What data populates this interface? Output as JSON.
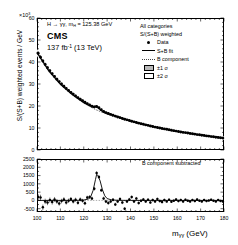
{
  "figure": {
    "exponent_label": "×10",
    "exponent_power": "3",
    "yaxis_title": "S/(S+B) weighted events / GeV",
    "xaxis_title_m": "m",
    "xaxis_title_sub": "γγ",
    "xaxis_title_unit": " (GeV)",
    "process_label_pre": "H → ",
    "process_label_gg": "γγ",
    "process_label_mass": ", m",
    "process_label_msub": "H",
    "process_label_val": " = 125.38 GeV",
    "experiment": "CMS",
    "lumi_value": "137 fb",
    "lumi_sup": "-1",
    "lumi_energy": " (13 TeV)",
    "lower_panel_label": "B component subtracted"
  },
  "legend": {
    "header1": "All categories",
    "header2": "S/(S+B) weighted",
    "entries": [
      {
        "label": "Data",
        "key": "marker"
      },
      {
        "label": "S+B fit",
        "key": "solid-line"
      },
      {
        "label": "B component",
        "key": "dotted-line"
      },
      {
        "label": "±1 σ",
        "key": "filled-box"
      },
      {
        "label": "±2 σ",
        "key": "open-box"
      }
    ]
  },
  "colors": {
    "axis": "#000000",
    "data": "#000000",
    "fit": "#000000",
    "bcomponent": "#444444",
    "band1sigma": "#b9b9b9",
    "band2sigma": "#ffffff",
    "background": "#ffffff"
  },
  "chart_data": {
    "type": "line",
    "xlabel": "m_γγ (GeV)",
    "ylabel": "S/(S+B) weighted events / GeV",
    "xlim": [
      100,
      180
    ],
    "ylim": [
      0,
      60
    ],
    "y_scale_factor": 1000,
    "grid": false,
    "xticks": [
      100,
      110,
      120,
      130,
      140,
      150,
      160,
      170,
      180
    ],
    "yticks": [
      0,
      10,
      20,
      30,
      40,
      50,
      60
    ],
    "panels": [
      {
        "name": "upper",
        "ylabel": "S/(S+B) weighted events / GeV",
        "ylim": [
          0,
          60
        ],
        "yticks": [
          0,
          10,
          20,
          30,
          40,
          50,
          60
        ],
        "series": [
          {
            "name": "Data",
            "type": "scatter",
            "x": [
              100.5,
              101.5,
              102.5,
              103.5,
              104.5,
              105.5,
              106.5,
              107.5,
              108.5,
              109.5,
              110.5,
              111.5,
              112.5,
              113.5,
              114.5,
              115.5,
              116.5,
              117.5,
              118.5,
              119.5,
              120.5,
              121.5,
              122.5,
              123.5,
              124.5,
              125.5,
              126.5,
              127.5,
              128.5,
              129.5,
              130.5,
              131.5,
              132.5,
              133.5,
              134.5,
              135.5,
              136.5,
              137.5,
              138.5,
              139.5,
              140.5,
              141.5,
              142.5,
              143.5,
              144.5,
              145.5,
              146.5,
              147.5,
              148.5,
              149.5,
              150.5,
              151.5,
              152.5,
              153.5,
              154.5,
              155.5,
              156.5,
              157.5,
              158.5,
              159.5,
              160.5,
              161.5,
              162.5,
              163.5,
              164.5,
              165.5,
              166.5,
              167.5,
              168.5,
              169.5,
              170.5,
              171.5,
              172.5,
              173.5,
              174.5,
              175.5,
              176.5,
              177.5,
              178.5,
              179.5
            ],
            "y": [
              44.0,
              42.2,
              40.5,
              38.9,
              37.4,
              36.0,
              34.7,
              33.4,
              32.2,
              31.1,
              30.0,
              29.0,
              28.0,
              27.1,
              26.2,
              25.4,
              24.6,
              23.8,
              23.1,
              22.4,
              21.7,
              21.1,
              20.5,
              19.9,
              19.6,
              19.8,
              19.2,
              18.3,
              17.5,
              17.0,
              16.6,
              16.2,
              15.8,
              15.4,
              15.0,
              14.7,
              14.3,
              14.0,
              13.7,
              13.4,
              13.1,
              12.8,
              12.5,
              12.2,
              11.9,
              11.7,
              11.4,
              11.2,
              10.9,
              10.7,
              10.4,
              10.2,
              10.0,
              9.8,
              9.6,
              9.4,
              9.2,
              9.0,
              8.8,
              8.6,
              8.4,
              8.2,
              8.0,
              7.9,
              7.7,
              7.5,
              7.4,
              7.2,
              7.0,
              6.9,
              6.7,
              6.6,
              6.4,
              6.3,
              6.1,
              6.0,
              5.8,
              5.7,
              5.6,
              5.4
            ],
            "yerr": [
              0.9,
              0.9,
              0.8,
              0.8,
              0.8,
              0.8,
              0.7,
              0.7,
              0.7,
              0.7,
              0.7,
              0.7,
              0.6,
              0.6,
              0.6,
              0.6,
              0.6,
              0.6,
              0.6,
              0.6,
              0.6,
              0.5,
              0.5,
              0.5,
              0.5,
              0.5,
              0.5,
              0.5,
              0.5,
              0.5,
              0.5,
              0.5,
              0.5,
              0.5,
              0.4,
              0.4,
              0.4,
              0.4,
              0.4,
              0.4,
              0.4,
              0.4,
              0.4,
              0.4,
              0.4,
              0.4,
              0.4,
              0.4,
              0.4,
              0.4,
              0.4,
              0.3,
              0.3,
              0.3,
              0.3,
              0.3,
              0.3,
              0.3,
              0.3,
              0.3,
              0.3,
              0.3,
              0.3,
              0.3,
              0.3,
              0.3,
              0.3,
              0.3,
              0.3,
              0.3,
              0.3,
              0.3,
              0.3,
              0.3,
              0.3,
              0.3,
              0.3,
              0.3,
              0.3,
              0.3
            ]
          },
          {
            "name": "S+B fit",
            "type": "line",
            "x": [
              100,
              105,
              110,
              115,
              120,
              122,
              124,
              125,
              126,
              127,
              128,
              130,
              135,
              140,
              145,
              150,
              155,
              160,
              165,
              170,
              175,
              180
            ],
            "y": [
              44.3,
              36.1,
              30.0,
              25.3,
              21.6,
              20.4,
              19.6,
              19.8,
              19.4,
              18.4,
              17.6,
              16.6,
              15.0,
              13.2,
              11.8,
              10.5,
              9.4,
              8.4,
              7.6,
              6.8,
              6.1,
              5.4
            ]
          },
          {
            "name": "B component",
            "type": "line",
            "x": [
              100,
              105,
              110,
              115,
              120,
              125,
              130,
              135,
              140,
              145,
              150,
              155,
              160,
              165,
              170,
              175,
              180
            ],
            "y": [
              44.3,
              36.1,
              30.0,
              25.3,
              21.5,
              18.4,
              16.2,
              14.6,
              13.1,
              11.8,
              10.5,
              9.4,
              8.4,
              7.6,
              6.8,
              6.1,
              5.4
            ]
          }
        ]
      },
      {
        "name": "lower",
        "label": "B component subtracted",
        "ylim": [
          -700,
          2500
        ],
        "yticks": [
          -500,
          0,
          500,
          1000,
          1500,
          2000,
          2500
        ],
        "series": [
          {
            "name": "Data minus B",
            "type": "scatter",
            "x": [
              100.5,
              101.5,
              102.5,
              103.5,
              104.5,
              105.5,
              106.5,
              107.5,
              108.5,
              109.5,
              110.5,
              111.5,
              112.5,
              113.5,
              114.5,
              115.5,
              116.5,
              117.5,
              118.5,
              119.5,
              120.5,
              121.5,
              122.5,
              123.5,
              124.5,
              125.5,
              126.5,
              127.5,
              128.5,
              129.5,
              130.5,
              131.5,
              132.5,
              133.5,
              134.5,
              135.5,
              136.5,
              137.5,
              138.5,
              139.5,
              140.5,
              141.5,
              142.5,
              143.5,
              144.5,
              145.5,
              146.5,
              147.5,
              148.5,
              149.5,
              150.5,
              151.5,
              152.5,
              153.5,
              154.5,
              155.5,
              156.5,
              157.5,
              158.5,
              159.5,
              160.5,
              161.5,
              162.5,
              163.5,
              164.5,
              165.5,
              166.5,
              167.5,
              168.5,
              169.5,
              170.5,
              171.5,
              172.5,
              173.5,
              174.5,
              175.5,
              176.5,
              177.5,
              178.5,
              179.5
            ],
            "y": [
              200,
              170,
              -420,
              -60,
              -130,
              20,
              -100,
              60,
              -60,
              -180,
              -40,
              60,
              -120,
              -20,
              80,
              -60,
              40,
              -140,
              60,
              -20,
              -170,
              170,
              200,
              120,
              700,
              1650,
              1420,
              620,
              120,
              -60,
              -150,
              -60,
              40,
              -240,
              -60,
              80,
              -130,
              -500,
              -60,
              60,
              200,
              -60,
              120,
              -160,
              -20,
              60,
              -60,
              40,
              -120,
              20,
              -60,
              80,
              -40,
              -100,
              20,
              -60,
              40,
              -80,
              -20,
              60,
              -40,
              20,
              -60,
              40,
              -20,
              -60,
              20,
              -40,
              60,
              -20,
              -60,
              20,
              -40,
              -10,
              40,
              -20,
              -60,
              20,
              -30,
              -60
            ],
            "yerr": [
              180,
              175,
              170,
              165,
              160,
              156,
              152,
              148,
              145,
              142,
              139,
              136,
              133,
              130,
              128,
              126,
              124,
              122,
              120,
              118,
              116,
              114,
              113,
              111,
              110,
              109,
              108,
              107,
              106,
              105,
              104,
              103,
              102,
              101,
              100,
              99,
              98,
              97,
              96,
              95,
              94,
              93,
              92,
              91,
              90,
              89,
              88,
              87,
              86,
              85,
              84,
              83,
              82,
              81,
              80,
              79,
              78,
              78,
              77,
              76,
              75,
              75,
              74,
              73,
              73,
              72,
              71,
              71,
              70,
              70,
              69,
              68,
              68,
              67,
              67,
              66,
              66,
              65,
              65,
              64
            ]
          },
          {
            "name": "Signal model",
            "type": "line",
            "x": [
              100,
              110,
              118,
              120,
              122,
              123,
              124,
              125,
              125.5,
              126,
              127,
              128,
              129,
              130,
              132,
              135,
              140,
              150,
              160,
              170,
              180
            ],
            "y": [
              0,
              0,
              5,
              20,
              90,
              230,
              600,
              1250,
              1560,
              1520,
              1180,
              640,
              280,
              110,
              25,
              5,
              0,
              0,
              0,
              0,
              0
            ]
          },
          {
            "name": "Zero reference",
            "type": "line",
            "style": "dotted",
            "x": [
              100,
              180
            ],
            "y": [
              0,
              0
            ]
          }
        ]
      }
    ]
  }
}
